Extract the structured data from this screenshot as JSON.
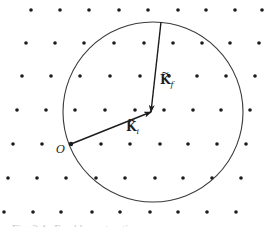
{
  "figure": {
    "colors": {
      "ink": "#1c1c1c",
      "background": "#ffffff",
      "caption": "#c8c8c8"
    },
    "lattice": {
      "dot_radius": 1.8,
      "rows": [
        {
          "y": 10,
          "x": [
            31,
            60,
            89,
            119,
            148,
            178,
            206,
            235,
            262
          ]
        },
        {
          "y": 43,
          "x": [
            26,
            55,
            84,
            114,
            144,
            173,
            202,
            230,
            259
          ]
        },
        {
          "y": 76,
          "x": [
            22,
            51,
            80,
            110,
            140,
            169,
            197,
            226,
            255
          ]
        },
        {
          "y": 110,
          "x": [
            17,
            46,
            75,
            105,
            135,
            164,
            193,
            221,
            250
          ]
        },
        {
          "y": 144,
          "x": [
            13,
            42,
            71,
            101,
            130,
            160,
            188,
            217,
            246
          ]
        },
        {
          "y": 178,
          "x": [
            8,
            37,
            66,
            96,
            125,
            155,
            183,
            212,
            241
          ]
        },
        {
          "y": 212,
          "x": [
            4,
            33,
            61,
            92,
            120,
            150,
            178,
            207,
            236
          ]
        }
      ]
    },
    "circle": {
      "cx": 153,
      "cy": 112,
      "r": 90
    },
    "vectors": [
      {
        "name": "k_i",
        "from": [
          71,
          144
        ],
        "to": [
          151,
          112
        ],
        "label": "K",
        "subscript": "i",
        "label_pos": [
          126,
          131
        ]
      },
      {
        "name": "k_f",
        "from": [
          161,
          22
        ],
        "to": [
          151,
          112
        ],
        "label": "K",
        "subscript": "f",
        "label_pos": [
          160,
          84
        ]
      }
    ],
    "origin": {
      "label": "O",
      "x": 71,
      "y": 144,
      "label_pos": [
        56,
        153
      ]
    },
    "caption_visible": "(caption text clipped at bottom edge — illegible)"
  }
}
